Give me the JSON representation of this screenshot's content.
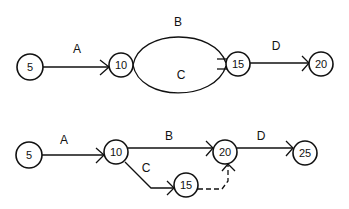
{
  "diagram": {
    "top": {
      "nodes": [
        {
          "id": "5",
          "label": "5"
        },
        {
          "id": "10",
          "label": "10"
        },
        {
          "id": "15",
          "label": "15"
        },
        {
          "id": "20",
          "label": "20"
        }
      ],
      "edges": [
        {
          "label": "A",
          "from": "5",
          "to": "10"
        },
        {
          "label": "B",
          "from": "10",
          "to": "15"
        },
        {
          "label": "C",
          "from": "10",
          "to": "15"
        },
        {
          "label": "D",
          "from": "15",
          "to": "20"
        }
      ]
    },
    "bottom": {
      "nodes": [
        {
          "id": "5",
          "label": "5"
        },
        {
          "id": "10",
          "label": "10"
        },
        {
          "id": "20",
          "label": "20"
        },
        {
          "id": "25",
          "label": "25"
        },
        {
          "id": "15",
          "label": "15"
        }
      ],
      "edges": [
        {
          "label": "A",
          "from": "5",
          "to": "10"
        },
        {
          "label": "B",
          "from": "10",
          "to": "20"
        },
        {
          "label": "C",
          "from": "10",
          "to": "15"
        },
        {
          "label": "D",
          "from": "20",
          "to": "25"
        },
        {
          "label": "",
          "from": "15",
          "to": "20",
          "style": "dashed"
        }
      ]
    }
  }
}
